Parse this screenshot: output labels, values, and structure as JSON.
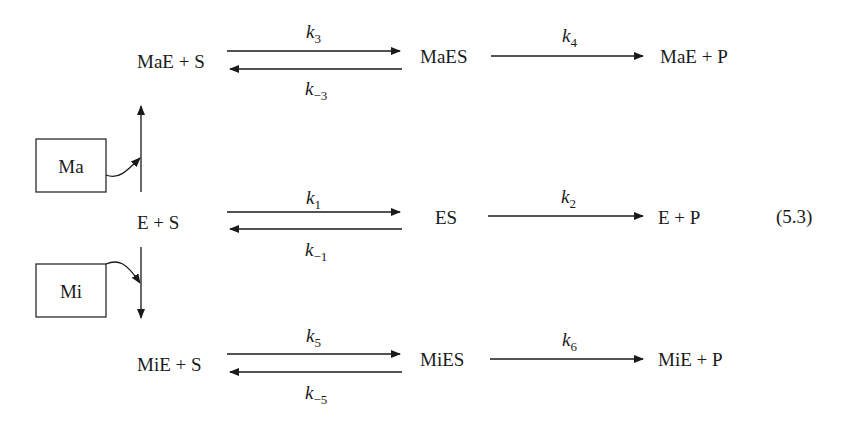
{
  "diagram": {
    "equation_number": "(5.3)",
    "modifiers": {
      "activator": {
        "label": "Ma"
      },
      "inhibitor": {
        "label": "Mi"
      }
    },
    "rows": {
      "top": {
        "reactants": "MaE + S",
        "complex": "MaES",
        "products": "MaE + P",
        "forward": {
          "k": "k",
          "sub": "3"
        },
        "reverse": {
          "k": "k",
          "sub": "−3"
        },
        "catalytic": {
          "k": "k",
          "sub": "4"
        }
      },
      "middle": {
        "reactants": "E + S",
        "complex": "ES",
        "products": "E + P",
        "forward": {
          "k": "k",
          "sub": "1"
        },
        "reverse": {
          "k": "k",
          "sub": "−1"
        },
        "catalytic": {
          "k": "k",
          "sub": "2"
        }
      },
      "bottom": {
        "reactants": "MiE + S",
        "complex": "MiES",
        "products": "MiE + P",
        "forward": {
          "k": "k",
          "sub": "5"
        },
        "reverse": {
          "k": "k",
          "sub": "−5"
        },
        "catalytic": {
          "k": "k",
          "sub": "6"
        }
      }
    },
    "colors": {
      "ink": "#1a1a1a",
      "background": "#ffffff"
    }
  }
}
